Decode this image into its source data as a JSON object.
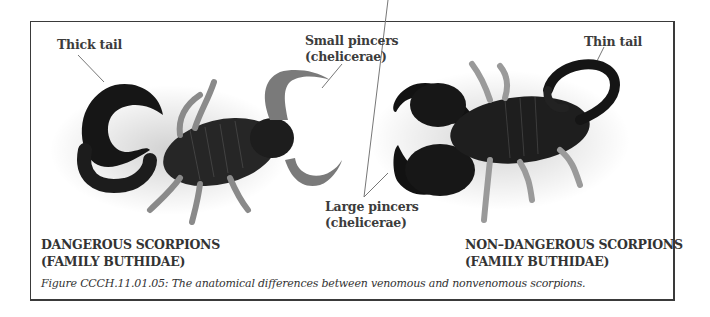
{
  "figure": {
    "callouts": {
      "thick_tail": "Thick tail",
      "small_pincers_line1": "Small pincers",
      "small_pincers_line2": "(chelicerae)",
      "thin_tail": "Thin tail",
      "large_pincers_line1": "Large pincers",
      "large_pincers_line2": "(chelicerae)"
    },
    "groups": {
      "dangerous_line1": "DANGEROUS SCORPIONS",
      "dangerous_line2": "(FAMILY BUTHIDAE)",
      "non_dangerous_line1": "NON–DANGEROUS SCORPIONS",
      "non_dangerous_line2": "(FAMILY BUTHIDAE)"
    },
    "caption": "Figure CCCH.11.01.05:  The anatomical differences between venomous and nonvenomous scorpions.",
    "colors": {
      "border": "#3a3a3a",
      "text": "#3c3c3c",
      "scorpion_dark": "#151515",
      "scorpion_leg": "#8a8a8a"
    }
  }
}
